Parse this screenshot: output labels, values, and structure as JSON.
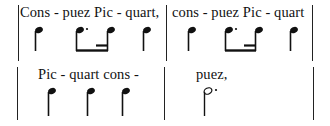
{
  "system1": {
    "measure1_lyric": "Cons - puez Pic - quart,",
    "measure2_lyric": "cons - puez Pic - quart",
    "rhythm": [
      "quarter",
      "dotted-eighth",
      "sixteenth",
      "quarter"
    ]
  },
  "system2": {
    "measure1_lyric": "Pic - quart cons -",
    "measure2_lyric": "puez,",
    "rhythm_m1": [
      "quarter",
      "quarter",
      "quarter"
    ],
    "rhythm_m2": [
      "dotted-half"
    ]
  },
  "colors": {
    "ink": "#111111",
    "background": "#ffffff"
  }
}
